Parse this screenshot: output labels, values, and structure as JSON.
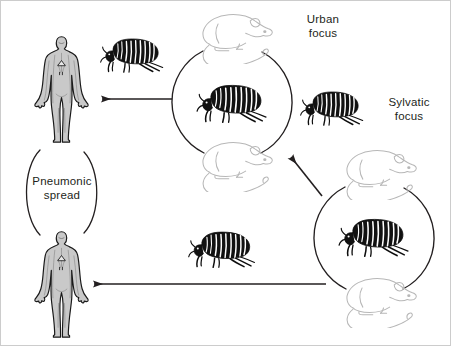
{
  "figure": {
    "background_color": "#ffffff",
    "border_color": "#c8c8c8",
    "ink_color": "#231f20",
    "rat_outline_color": "#b7b7b7"
  },
  "labels": {
    "urban_focus": "Urban\nfocus",
    "sylvatic_focus": "Sylvatic\nfocus",
    "pneumonic_spread": "Pneumonic\nspread"
  },
  "cycles": [
    {
      "name": "urban-focus-cycle",
      "label": "Urban focus",
      "center_x": 232,
      "center_y": 102,
      "radius": 57,
      "center_creature": "flea",
      "top_creature": "rat",
      "bottom_creature": "rat"
    },
    {
      "name": "sylvatic-focus-cycle",
      "label": "Sylvatic focus",
      "center_x": 374,
      "center_y": 238,
      "radius": 57,
      "center_creature": "flea",
      "top_creature": "rat",
      "bottom_creature": "rat"
    }
  ],
  "humans": [
    {
      "name": "human-upper",
      "x": 60,
      "y": 90,
      "role": "bubonic-plague-case"
    },
    {
      "name": "human-lower",
      "x": 60,
      "y": 285,
      "role": "bubonic-plague-case"
    }
  ],
  "fleas": [
    {
      "name": "flea-urban-to-human",
      "x": 130,
      "y": 55
    },
    {
      "name": "flea-urban-center",
      "x": 232,
      "y": 100
    },
    {
      "name": "flea-between-cycles",
      "x": 330,
      "y": 107
    },
    {
      "name": "flea-sylvatic-to-human",
      "x": 222,
      "y": 247
    },
    {
      "name": "flea-sylvatic-center",
      "x": 374,
      "y": 236
    }
  ],
  "arrows": [
    {
      "name": "arrow-urban-to-human",
      "from_x": 172,
      "from_y": 99,
      "to_x": 98,
      "to_y": 99
    },
    {
      "name": "arrow-sylvatic-to-urban",
      "from_x": 322,
      "from_y": 196,
      "to_x": 288,
      "to_y": 154
    },
    {
      "name": "arrow-sylvatic-to-human",
      "from_x": 325,
      "from_y": 284,
      "to_x": 90,
      "to_y": 284
    }
  ],
  "pneumonic_loop": {
    "name": "pneumonic-spread-loop",
    "center_x": 62,
    "center_y": 192,
    "radius_x": 42,
    "radius_y": 45
  }
}
